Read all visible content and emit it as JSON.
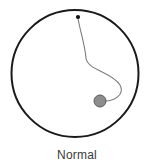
{
  "figure": {
    "caption": "Normal",
    "background_color": "#ffffff",
    "outline_color": "#1a1a1a",
    "cord_color": "#7d7d7d",
    "marker_color": "#111111",
    "body_fill_color": "#8d8d8d",
    "body_stroke_color": "#5a5a5a",
    "caption_color": "#3a3a3a"
  },
  "chart_data": {
    "type": "diagram",
    "title": "Normal",
    "xlabel": "",
    "ylabel": "",
    "grid": false,
    "legend": null,
    "elements": [
      {
        "name": "boundary-circle",
        "shape": "circle",
        "cx": 75,
        "cy": 73.5,
        "r": 63.5,
        "fill": "none",
        "stroke": "#1a1a1a",
        "stroke_width": 2.0
      },
      {
        "name": "attachment-point",
        "shape": "dot",
        "cx": 78,
        "cy": 17,
        "r": 2.1,
        "fill": "#111111"
      },
      {
        "name": "cord-path",
        "shape": "path",
        "d": "M 78 18 C 80 31, 85 45, 86 58 C 87 70, 112 72, 120 85 C 125 94, 115 101, 105 101",
        "fill": "none",
        "stroke": "#7d7d7d",
        "stroke_width": 1.1
      },
      {
        "name": "body-circle",
        "shape": "circle",
        "cx": 100,
        "cy": 101,
        "r": 6,
        "fill": "#8d8d8d",
        "stroke": "#5a5a5a",
        "stroke_width": 1.0
      }
    ],
    "annotations": [
      {
        "text": "Normal",
        "x": 77,
        "y": 159,
        "anchor": "middle"
      }
    ]
  }
}
